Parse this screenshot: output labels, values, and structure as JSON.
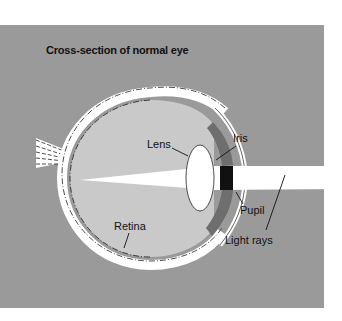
{
  "diagram": {
    "title": "Cross-section of normal eye",
    "labels": {
      "lens": "Lens",
      "iris": "Iris",
      "pupil": "Pupil",
      "retina": "Retina",
      "light_rays": "Light rays"
    },
    "colors": {
      "background": "#9a9a9a",
      "eyeball_interior": "#c9c9c9",
      "sclera": "#ffffff",
      "pupil": "#111111",
      "light_beam": "#ffffff"
    }
  }
}
